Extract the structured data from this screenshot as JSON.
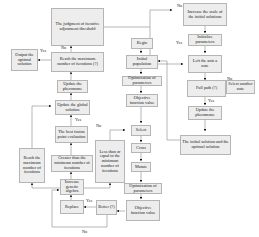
{
  "diagram": {
    "type": "flowchart",
    "nodes": {
      "judgement": "The judgment of iterative adjustment threshold",
      "reach_max_top": "Reach the maximum number of iterations (?)",
      "output": "Output the optimal solution",
      "update_pheromone_left": "Update the pheromone",
      "update_global": "Update the global solution",
      "best_fusion": "The best fusion point evaluation",
      "greater_than": "Greater than the minimum number of iterations",
      "reach_max_left": "Reach the maximum number of iterations",
      "less_than": "Less than or equal to the minimum number of iterations",
      "increase_genetic": "Increase genetic algebra",
      "replace": "Replace",
      "better": "Better (?)",
      "begin": "Begin",
      "initial_population": "Initial population",
      "optimization_top": "Optimization of parameters",
      "objective_top": "Objective function value",
      "select": "Select",
      "cross": "Cross",
      "mutate": "Mutate",
      "optimization_bottom": "Optimization of parameters",
      "objective_bottom": "Objective function value",
      "increase_scale": "Increase the scale of the initial solutions",
      "initialize": "Initialize parameters",
      "left_ants": "Left the ants a note",
      "full_path": "Full path (?)",
      "select_another": "Select another note",
      "update_pheromone_right": "Update the pheromone",
      "initial_optimal": "The initial solution and the optimal solution"
    },
    "edge_labels": {
      "yes_output": "Yes",
      "no_judgement": "No",
      "yes_best": "Yes",
      "no_best": "No",
      "yes_replace": "Yes",
      "no_better": "No",
      "no_increase": "No",
      "yes_initialize": "Yes",
      "no_full_path": "No",
      "yes_full_path": "Yes"
    }
  }
}
